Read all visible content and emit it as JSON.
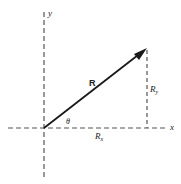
{
  "diagram": {
    "type": "vector-components",
    "origin": {
      "x": 44,
      "y": 128
    },
    "tip": {
      "x": 147,
      "y": 48
    },
    "colors": {
      "line": "#1a1a1a",
      "dash": "#555555",
      "text": "#222222"
    },
    "labels": {
      "y_axis": "y",
      "x_axis": "x",
      "vector": "R",
      "angle": "θ",
      "rx_main": "R",
      "rx_sub": "x",
      "ry_main": "R",
      "ry_sub": "y"
    }
  }
}
